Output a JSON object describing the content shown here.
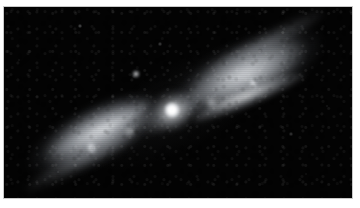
{
  "image": {
    "kind": "astronomical-photograph",
    "subject_label": "bipolar planetary nebula",
    "alt_text": "Grayscale astronomical photograph of a bipolar planetary nebula with two elongated lobes extending from lower left to upper right, a bright central star at the waist, and faint field stars on a black sky background.",
    "colorization": "grayscale",
    "frame": {
      "page_background": "#ffffff",
      "sky_background": "#030303",
      "border_color": "#c9c9c9",
      "plate_left": 4,
      "plate_top": 7,
      "plate_width": 348,
      "plate_height": 191
    }
  },
  "nebula": {
    "label": "bipolar-nebula",
    "axis_angle_deg": -29,
    "center_x": 168,
    "center_y": 104,
    "brightness_peak": "#ffffff",
    "lobe_tint": "#b9bcc0",
    "lobes": [
      {
        "label": "southwest-lobe",
        "position": "lower-left",
        "center_x": 86,
        "center_y": 142,
        "length": 150,
        "width": 56,
        "angle_deg": -29,
        "peak_gray": "#c8cbcf"
      },
      {
        "label": "northeast-lobe",
        "position": "upper-right",
        "center_x": 253,
        "center_y": 69,
        "length": 165,
        "width": 62,
        "angle_deg": -29,
        "peak_gray": "#cdd0d4"
      }
    ],
    "knots": [
      {
        "label": "knot-southwest",
        "x": 89,
        "y": 140,
        "size": 13,
        "gray": "#eef0f2"
      },
      {
        "label": "knot-northeast",
        "x": 249,
        "y": 77,
        "size": 11,
        "gray": "#f0f2f4"
      },
      {
        "label": "knot-inner-southwest",
        "x": 126,
        "y": 125,
        "size": 8,
        "gray": "#d8dadd"
      },
      {
        "label": "knot-inner-northeast",
        "x": 208,
        "y": 96,
        "size": 9,
        "gray": "#dcdee1"
      }
    ],
    "rims": [
      {
        "label": "rim-northeast-lower",
        "x": 196,
        "y": 88,
        "length": 116,
        "angle_deg": -23
      },
      {
        "label": "rim-southwest-upper",
        "x": 46,
        "y": 132,
        "length": 110,
        "angle_deg": -27
      }
    ]
  },
  "central_star": {
    "label": "central-star",
    "x": 172,
    "y": 110,
    "core_diameter": 9,
    "halo_diameter": 40,
    "core_color": "#ffffff",
    "halo_color": "#dfe2e6"
  },
  "field_stars": [
    {
      "label": "field-star-1",
      "x": 136,
      "y": 74,
      "size": 4.0,
      "brightness": 0.95
    },
    {
      "label": "field-star-2",
      "x": 80,
      "y": 26,
      "size": 1.8,
      "brightness": 0.42
    },
    {
      "label": "field-star-3",
      "x": 160,
      "y": 44,
      "size": 1.6,
      "brightness": 0.33
    },
    {
      "label": "field-star-4",
      "x": 291,
      "y": 134,
      "size": 1.6,
      "brightness": 0.3
    },
    {
      "label": "field-star-5",
      "x": 58,
      "y": 172,
      "size": 1.4,
      "brightness": 0.26
    },
    {
      "label": "field-star-6",
      "x": 327,
      "y": 106,
      "size": 1.4,
      "brightness": 0.24
    },
    {
      "label": "field-star-7",
      "x": 19,
      "y": 60,
      "size": 1.3,
      "brightness": 0.2
    },
    {
      "label": "field-star-8",
      "x": 306,
      "y": 174,
      "size": 1.3,
      "brightness": 0.18
    }
  ]
}
